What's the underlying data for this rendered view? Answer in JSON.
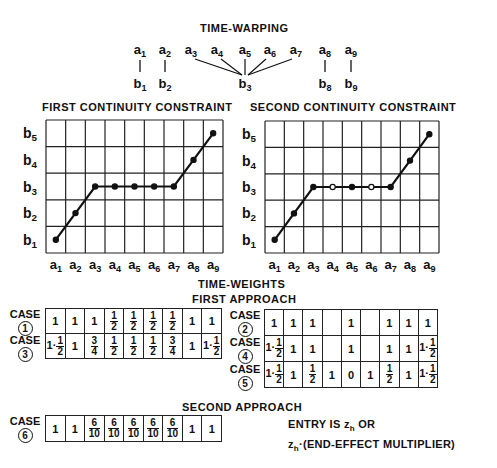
{
  "time_warping": {
    "title": "TIME-WARPING",
    "a_labels": [
      "a1",
      "a2",
      "a3",
      "a4",
      "a5",
      "a6",
      "a7",
      "a8",
      "a9"
    ],
    "b_labels": [
      {
        "label": "b1",
        "from": [
          "a1"
        ]
      },
      {
        "label": "b2",
        "from": [
          "a2"
        ]
      },
      {
        "label": "b3",
        "from": [
          "a3",
          "a4",
          "a5",
          "a6",
          "a7"
        ]
      },
      {
        "label": "b8",
        "from": [
          "a8"
        ]
      },
      {
        "label": "b9",
        "from": [
          "a9"
        ]
      }
    ]
  },
  "chart_data": [
    {
      "type": "line",
      "title": "FIRST CONTINUITY CONSTRAINT",
      "x": [
        "a1",
        "a2",
        "a3",
        "a4",
        "a5",
        "a6",
        "a7",
        "a8",
        "a9"
      ],
      "y_ticks": [
        "b1",
        "b2",
        "b3",
        "b4",
        "b5"
      ],
      "series": [
        {
          "name": "warping path",
          "values": [
            1,
            2,
            3,
            3,
            3,
            3,
            3,
            4,
            5
          ]
        }
      ],
      "point_style": [
        "filled",
        "filled",
        "filled",
        "filled",
        "filled",
        "filled",
        "filled",
        "filled",
        "filled"
      ],
      "grid": true
    },
    {
      "type": "line",
      "title": "SECOND CONTINUITY CONSTRAINT",
      "x": [
        "a1",
        "a2",
        "a3",
        "a4",
        "a5",
        "a6",
        "a7",
        "a8",
        "a9"
      ],
      "y_ticks": [
        "b1",
        "b2",
        "b3",
        "b4",
        "b5"
      ],
      "series": [
        {
          "name": "warping path",
          "values": [
            1,
            2,
            3,
            3,
            3,
            3,
            3,
            4,
            5
          ]
        }
      ],
      "point_style": [
        "filled",
        "filled",
        "filled",
        "open",
        "filled",
        "open",
        "filled",
        "filled",
        "filled"
      ],
      "grid": true
    }
  ],
  "time_weights": {
    "title": "TIME-WEIGHTS",
    "first_approach": {
      "title": "FIRST APPROACH",
      "left_table": [
        {
          "case": "CASE",
          "num": "1",
          "cells": [
            "1",
            "1",
            "1",
            "1/2",
            "1/2",
            "1/2",
            "1/2",
            "1",
            "1"
          ]
        },
        {
          "case": "CASE",
          "num": "3",
          "cells": [
            "1·1/2",
            "1",
            "3/4",
            "1/2",
            "1/2",
            "1/2",
            "3/4",
            "1",
            "1·1/2"
          ]
        }
      ],
      "right_table": [
        {
          "case": "CASE",
          "num": "2",
          "cells": [
            "1",
            "1",
            "1",
            "",
            "1",
            "",
            "1",
            "1",
            "1"
          ]
        },
        {
          "case": "CASE",
          "num": "4",
          "cells": [
            "1·1/2",
            "1",
            "1",
            "",
            "1",
            "",
            "1",
            "1",
            "1·1/2"
          ]
        },
        {
          "case": "CASE",
          "num": "5",
          "cells": [
            "1·1/2",
            "1",
            "1/2",
            "1",
            "0",
            "1",
            "1/2",
            "1",
            "1·1/2"
          ]
        }
      ]
    },
    "second_approach": {
      "title": "SECOND APPROACH",
      "table": [
        {
          "case": "CASE",
          "num": "6",
          "cells": [
            "1",
            "1",
            "6/10",
            "6/10",
            "6/10",
            "6/10",
            "6/10",
            "1",
            "1"
          ]
        }
      ]
    },
    "note_line1": "ENTRY IS z_h OR",
    "note_line2": "z_h·(END-EFFECT MULTIPLIER)"
  }
}
